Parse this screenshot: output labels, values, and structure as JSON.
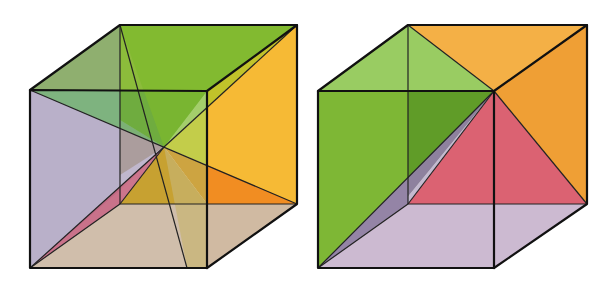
{
  "figure": {
    "cubes": [
      {
        "id": "left-cube",
        "decomposition": "six square pyramids meeting at cube center",
        "colors": {
          "top": "#86b830",
          "left": "#b7b1cf",
          "right": "#f6b62a",
          "bottom": "#cdbba6",
          "front": "#c79c2a",
          "back": "#8aa86a",
          "sliver": "#c0607a"
        }
      },
      {
        "id": "right-cube",
        "decomposition": "three pyramids sharing apex at front-top-right vertex",
        "colors": {
          "left": "#7ab52e",
          "top": "#f3ac3c",
          "right": "#ee9a2a",
          "bottom": "#c9b6cf",
          "back": "#d95a6a",
          "sliver": "#7a6a8c"
        }
      }
    ]
  }
}
